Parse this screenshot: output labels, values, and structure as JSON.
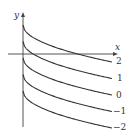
{
  "chart_data": {
    "type": "line",
    "title": "",
    "xlabel": "x",
    "ylabel": "y",
    "grid": false,
    "legend_position": "inline-right",
    "series": [
      {
        "name": "2",
        "C": 2
      },
      {
        "name": "1",
        "C": 1
      },
      {
        "name": "0",
        "C": 0
      },
      {
        "name": "-1",
        "C": -1
      },
      {
        "name": "-2",
        "C": -2
      }
    ],
    "curve_labels": [
      "2",
      "1",
      "0",
      "−1",
      "−2"
    ]
  },
  "style": {
    "axis_color": "#555555",
    "curve_color": "#333333"
  }
}
